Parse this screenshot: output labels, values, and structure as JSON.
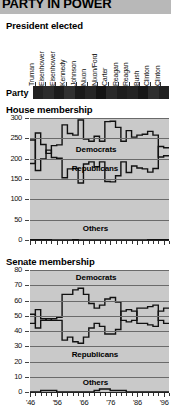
{
  "title": "PARTY IN POWER",
  "sections": {
    "president": {
      "heading": "President elected",
      "party_row_label": "Party",
      "presidents": [
        "Truman",
        "Eisenhower",
        "Eisenhower",
        "Kennedy",
        "Johnson",
        "Nixon",
        "Nixon/Ford",
        "Carter",
        "Reagan",
        "Reagan",
        "Bush",
        "Clinton",
        "Clinton"
      ]
    },
    "house": {
      "heading": "House membership"
    },
    "senate": {
      "heading": "Senate membership"
    }
  },
  "series_labels": {
    "democrats": "Democrats",
    "republicans": "Republicans",
    "others": "Others"
  },
  "colors": {
    "title_band": "#b8b8b8",
    "plot_background": "#c9c9c9",
    "gridline": "#6a6a6a",
    "line": "#111111",
    "party_bar": "#1a1a1a"
  },
  "chart_data": [
    {
      "type": "line",
      "title": "House membership",
      "xlabel": "",
      "ylabel": "",
      "ylim": [
        0,
        300
      ],
      "yticks": [
        300,
        250,
        200,
        150,
        100,
        50,
        0
      ],
      "grid": true,
      "legend_position": "inline",
      "x": [
        1946,
        1948,
        1950,
        1952,
        1954,
        1956,
        1958,
        1960,
        1962,
        1964,
        1966,
        1968,
        1970,
        1972,
        1974,
        1976,
        1978,
        1980,
        1982,
        1984,
        1986,
        1988,
        1990,
        1992,
        1994,
        1996
      ],
      "xticklabels": [
        "'46",
        "'56",
        "'66",
        "'76",
        "'86",
        "'96"
      ],
      "series": [
        {
          "name": "Democrats",
          "values": [
            188,
            263,
            235,
            213,
            232,
            234,
            283,
            262,
            258,
            295,
            248,
            243,
            255,
            243,
            291,
            292,
            277,
            243,
            269,
            253,
            258,
            260,
            267,
            258,
            204,
            207
          ]
        },
        {
          "name": "Republicans",
          "values": [
            246,
            171,
            199,
            221,
            203,
            201,
            153,
            175,
            176,
            140,
            187,
            192,
            180,
            192,
            144,
            143,
            158,
            192,
            166,
            182,
            177,
            175,
            167,
            176,
            230,
            227
          ]
        },
        {
          "name": "Others",
          "values": [
            1,
            1,
            1,
            1,
            0,
            0,
            0,
            0,
            1,
            0,
            0,
            0,
            0,
            0,
            0,
            0,
            0,
            0,
            0,
            0,
            0,
            0,
            1,
            1,
            1,
            1
          ]
        }
      ]
    },
    {
      "type": "line",
      "title": "Senate membership",
      "xlabel": "",
      "ylabel": "",
      "ylim": [
        0,
        80
      ],
      "yticks": [
        80,
        70,
        60,
        50,
        40,
        30,
        20,
        10,
        0
      ],
      "grid": true,
      "legend_position": "inline",
      "x": [
        1946,
        1948,
        1950,
        1952,
        1954,
        1956,
        1958,
        1960,
        1962,
        1964,
        1966,
        1968,
        1970,
        1972,
        1974,
        1976,
        1978,
        1980,
        1982,
        1984,
        1986,
        1988,
        1990,
        1992,
        1994,
        1996
      ],
      "xticklabels": [
        "'46",
        "'56",
        "'66",
        "'76",
        "'86",
        "'96"
      ],
      "series": [
        {
          "name": "Democrats",
          "values": [
            45,
            54,
            48,
            47,
            48,
            49,
            64,
            64,
            67,
            68,
            64,
            58,
            55,
            57,
            61,
            62,
            59,
            47,
            46,
            47,
            55,
            55,
            56,
            57,
            47,
            45
          ]
        },
        {
          "name": "Republicans",
          "values": [
            51,
            42,
            47,
            48,
            47,
            47,
            34,
            36,
            33,
            32,
            36,
            42,
            45,
            43,
            38,
            38,
            41,
            53,
            54,
            53,
            45,
            45,
            44,
            43,
            53,
            55
          ]
        },
        {
          "name": "Others",
          "values": [
            0,
            0,
            1,
            1,
            1,
            0,
            0,
            0,
            0,
            0,
            0,
            0,
            1,
            2,
            2,
            1,
            1,
            1,
            0,
            0,
            0,
            0,
            0,
            0,
            0,
            0
          ]
        }
      ]
    }
  ]
}
